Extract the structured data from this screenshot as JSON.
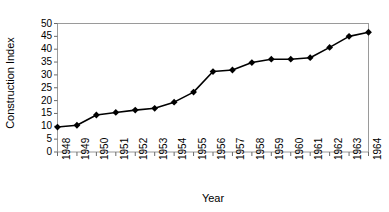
{
  "chart_data": {
    "type": "line",
    "title": "",
    "xlabel": "Year",
    "ylabel": "Construction Index",
    "x": [
      1948,
      1949,
      1950,
      1951,
      1952,
      1953,
      1954,
      1955,
      1956,
      1957,
      1958,
      1959,
      1960,
      1961,
      1962,
      1963,
      1964
    ],
    "categories": [
      "1948",
      "1949",
      "1950",
      "1951",
      "1952",
      "1953",
      "1954",
      "1955",
      "1956",
      "1957",
      "1958",
      "1959",
      "1960",
      "1961",
      "1962",
      "1963",
      "1964"
    ],
    "values": [
      9.7,
      10.4,
      14.4,
      15.4,
      16.3,
      17.0,
      19.4,
      23.3,
      31.3,
      31.9,
      34.8,
      36.1,
      36.1,
      36.7,
      40.7,
      45.0,
      46.6
    ],
    "series": [
      {
        "name": "Construction Index",
        "values": [
          9.7,
          10.4,
          14.4,
          15.4,
          16.3,
          17.0,
          19.4,
          23.3,
          31.3,
          31.9,
          34.8,
          36.1,
          36.1,
          36.7,
          40.7,
          45.0,
          46.6
        ],
        "color": "#000000",
        "marker": "diamond"
      }
    ],
    "ylim": [
      0,
      50
    ],
    "yticks": [
      0,
      5,
      10,
      15,
      20,
      25,
      30,
      35,
      40,
      45,
      50
    ],
    "ytick_labels": [
      "0",
      "5",
      "10",
      "15",
      "20",
      "25",
      "30",
      "35",
      "40",
      "45",
      "50"
    ],
    "grid": false,
    "legend": false,
    "legend_position": "none",
    "xtick_rotation": 90,
    "frame_color": "#808080",
    "line_color": "#000000"
  }
}
